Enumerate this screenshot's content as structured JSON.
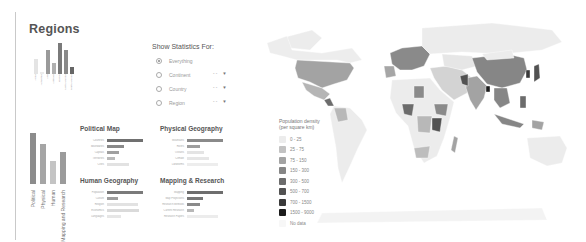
{
  "title": "Regions",
  "mini_chart": {
    "bars": [
      {
        "label": "Africa",
        "value": 30,
        "color": "#e4e4e4"
      },
      {
        "label": "Antarctica",
        "value": 4,
        "color": "#ececec"
      },
      {
        "label": "Asia",
        "value": 48,
        "color": "#9a9a9a"
      },
      {
        "label": "Australia",
        "value": 22,
        "color": "#b0b0b0"
      },
      {
        "label": "Europe",
        "value": 62,
        "color": "#7a7a7a"
      },
      {
        "label": "North America",
        "value": 48,
        "color": "#8a8a8a"
      },
      {
        "label": "South America",
        "value": 14,
        "color": "#666666"
      }
    ]
  },
  "statistics": {
    "title": "Show Statistics For:",
    "options": [
      {
        "label": "Everything",
        "selected": true,
        "has_control": false
      },
      {
        "label": "Continent",
        "selected": false,
        "has_control": true
      },
      {
        "label": "Country",
        "selected": false,
        "has_control": true
      },
      {
        "label": "Region",
        "selected": false,
        "has_control": true
      }
    ],
    "control_dash": "- -",
    "control_arrow": "▼"
  },
  "category_chart": {
    "bars": [
      {
        "label": "Political",
        "value": 78,
        "color": "#8c8c8c"
      },
      {
        "label": "Physical",
        "value": 62,
        "color": "#a5a5a5"
      },
      {
        "label": "Human",
        "value": 36,
        "color": "#c4c4c4"
      },
      {
        "label": "Mapping and Research",
        "value": 50,
        "color": "#9b9b9b"
      }
    ]
  },
  "panels": [
    {
      "title": "Political Map",
      "rows": [
        {
          "label": "Countries",
          "value": 100,
          "color": "#707070"
        },
        {
          "label": "Boundaries",
          "value": 48,
          "color": "#8a8a8a"
        },
        {
          "label": "Capitals",
          "value": 34,
          "color": "#a0a0a0"
        },
        {
          "label": "Territories",
          "value": 22,
          "color": "#bbbbbb"
        },
        {
          "label": "Cities",
          "value": 60,
          "color": "#e2e2e2"
        }
      ]
    },
    {
      "title": "Physical Geography",
      "rows": [
        {
          "label": "Mountains",
          "value": 100,
          "color": "#8a8a8a"
        },
        {
          "label": "Rivers",
          "value": 35,
          "color": "#9e9e9e"
        },
        {
          "label": "Oceans",
          "value": 48,
          "color": "#e4e4e4"
        },
        {
          "label": "Climate",
          "value": 62,
          "color": "#e6e6e6"
        },
        {
          "label": "Landforms",
          "value": 85,
          "color": "#ededed"
        }
      ]
    },
    {
      "title": "Human Geography",
      "rows": [
        {
          "label": "Population",
          "value": 100,
          "color": "#7a7a7a"
        },
        {
          "label": "Culture",
          "value": 30,
          "color": "#9e9e9e"
        },
        {
          "label": "Religion",
          "value": 85,
          "color": "#e2e2e2"
        },
        {
          "label": "Economics",
          "value": 88,
          "color": "#dadada"
        },
        {
          "label": "Languages",
          "value": 40,
          "color": "#e6e6e6"
        }
      ]
    },
    {
      "title": "Mapping & Research",
      "rows": [
        {
          "label": "Mapping",
          "value": 100,
          "color": "#6e6e6e"
        },
        {
          "label": "Map Projections",
          "value": 45,
          "color": "#777777"
        },
        {
          "label": "Research Methods",
          "value": 35,
          "color": "#8a8a8a"
        },
        {
          "label": "Current Research",
          "value": 20,
          "color": "#b8b8b8"
        },
        {
          "label": "Research Papers",
          "value": 85,
          "color": "#ececec"
        }
      ]
    }
  ],
  "map": {
    "legend_title_1": "Population density",
    "legend_title_2": "(per square km)",
    "legend": [
      {
        "label": "0 - 25",
        "color": "#ececec"
      },
      {
        "label": "25 - 75",
        "color": "#c2c2c2"
      },
      {
        "label": "75 - 150",
        "color": "#a3a3a3"
      },
      {
        "label": "150 - 300",
        "color": "#868686"
      },
      {
        "label": "300 - 500",
        "color": "#6c6c6c"
      },
      {
        "label": "500 - 700",
        "color": "#525252"
      },
      {
        "label": "700 - 1500",
        "color": "#3a3a3a"
      },
      {
        "label": "1500 - 9000",
        "color": "#1c1c1c"
      },
      {
        "label": "No data",
        "color": "#f7f7f7"
      }
    ]
  }
}
